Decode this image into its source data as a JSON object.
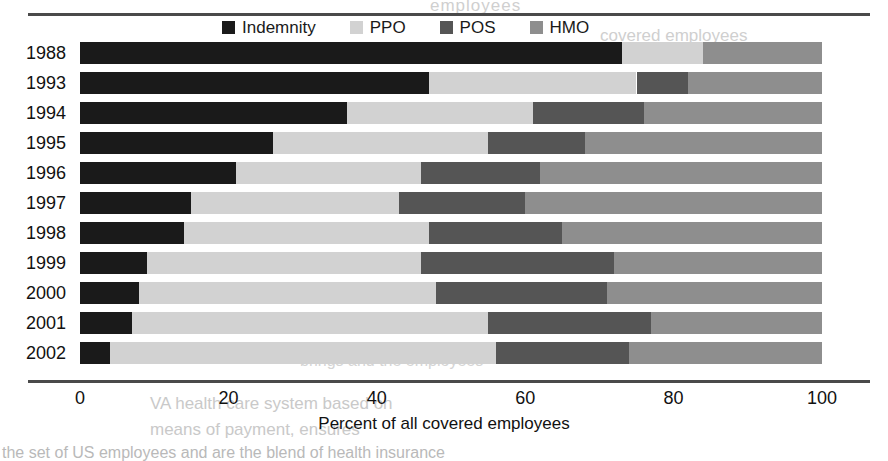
{
  "chart_data": {
    "type": "bar",
    "orientation": "horizontal",
    "stacked": true,
    "title": "",
    "xlabel": "Percent of all covered employees",
    "ylabel": "",
    "xlim": [
      0,
      100
    ],
    "xticks": [
      0,
      20,
      40,
      60,
      80,
      100
    ],
    "grid": false,
    "legend_position": "top-center",
    "categories": [
      "1988",
      "1993",
      "1994",
      "1995",
      "1996",
      "1997",
      "1998",
      "1999",
      "2000",
      "2001",
      "2002"
    ],
    "series": [
      {
        "name": "Indemnity",
        "color": "#1a1a1a",
        "values": [
          73,
          47,
          36,
          26,
          21,
          15,
          14,
          9,
          8,
          7,
          4
        ]
      },
      {
        "name": "PPO",
        "color": "#d2d2d2",
        "values": [
          11,
          28,
          25,
          29,
          25,
          28,
          33,
          37,
          40,
          48,
          52
        ]
      },
      {
        "name": "POS",
        "color": "#555555",
        "values": [
          0,
          7,
          15,
          13,
          16,
          17,
          18,
          26,
          23,
          22,
          18
        ]
      },
      {
        "name": "HMO",
        "color": "#8e8e8e",
        "values": [
          16,
          18,
          24,
          32,
          38,
          40,
          35,
          28,
          29,
          23,
          26
        ]
      }
    ]
  },
  "legend": {
    "items": [
      {
        "label": "Indemnity",
        "color": "#1a1a1a"
      },
      {
        "label": "PPO",
        "color": "#d2d2d2"
      },
      {
        "label": "POS",
        "color": "#555555"
      },
      {
        "label": "HMO",
        "color": "#8e8e8e"
      }
    ]
  },
  "axis": {
    "x_title": "Percent of all covered employees",
    "x_tick_labels": [
      "0",
      "20",
      "40",
      "60",
      "80",
      "100"
    ]
  },
  "background_text": {
    "top": "employees",
    "right": "covered employees",
    "mid": "brings and the employees",
    "low1": "VA health care system based on",
    "low2": "means of payment, ensures",
    "bottom": "the set of US employees and are the blend of health insurance"
  }
}
